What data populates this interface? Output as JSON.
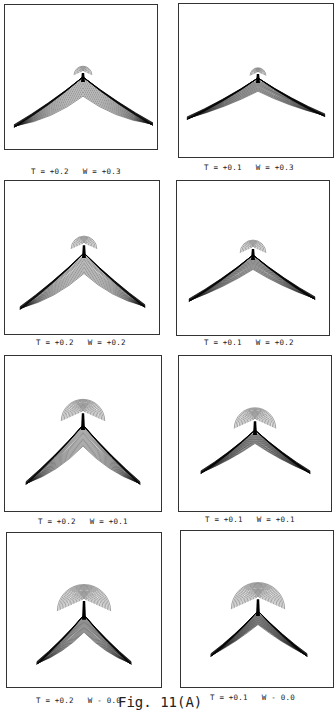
{
  "figure": {
    "caption": "Fig. 11(A)",
    "panels": [
      {
        "id": "r1l",
        "T": "+0.2",
        "W": "+0.3",
        "label": "T = +0.2   W = +0.3",
        "box": [
          4,
          4,
          154,
          146
        ],
        "labelPos": [
          31,
          167
        ],
        "cusp": [
          79,
          75
        ],
        "armL": [
          9,
          124
        ],
        "armR": [
          150,
          122
        ],
        "lobeR": 9,
        "lobeCy": -8,
        "nLines": 14,
        "spread": 0.34
      },
      {
        "id": "r1r",
        "T": "+0.1",
        "W": "+0.3",
        "label": "T = +0.1   W = +0.3",
        "box": [
          178,
          3,
          156,
          155
        ],
        "labelPos": [
          204,
          163
        ],
        "cusp": [
          80,
          77
        ],
        "armL": [
          8,
          117
        ],
        "armR": [
          148,
          114
        ],
        "lobeR": 8,
        "lobeCy": -8,
        "nLines": 14,
        "spread": 0.16
      },
      {
        "id": "r2l",
        "T": "+0.2",
        "W": "+0.2",
        "label": "T = +0.2   W = +0.2",
        "box": [
          4,
          180,
          156,
          155
        ],
        "labelPos": [
          36,
          338
        ],
        "cusp": [
          80,
          75
        ],
        "armL": [
          15,
          130
        ],
        "armR": [
          142,
          128
        ],
        "lobeR": 13,
        "lobeCy": -12,
        "nLines": 15,
        "spread": 0.3
      },
      {
        "id": "r2r",
        "T": "+0.1",
        "W": "+0.2",
        "label": "T = +0.1   W = +0.2",
        "box": [
          176,
          180,
          154,
          156
        ],
        "labelPos": [
          204,
          338
        ],
        "cusp": [
          77,
          77
        ],
        "armL": [
          12,
          122
        ],
        "armR": [
          140,
          120
        ],
        "lobeR": 13,
        "lobeCy": -10,
        "nLines": 15,
        "spread": 0.15
      },
      {
        "id": "r3l",
        "T": "+0.2",
        "W": "+0.1",
        "label": "T = +0.2   W = +0.1",
        "box": [
          4,
          355,
          158,
          157
        ],
        "labelPos": [
          38,
          517
        ],
        "cusp": [
          79,
          72
        ],
        "armL": [
          21,
          130
        ],
        "armR": [
          137,
          130
        ],
        "lobeR": 22,
        "lobeCy": -16,
        "nLines": 17,
        "spread": 0.28
      },
      {
        "id": "r3r",
        "T": "+0.1",
        "W": "+0.1",
        "label": "T = +0.1   W = +0.1",
        "box": [
          178,
          355,
          154,
          157
        ],
        "labelPos": [
          205,
          515
        ],
        "cusp": [
          77,
          77
        ],
        "armL": [
          22,
          119
        ],
        "armR": [
          133,
          119
        ],
        "lobeR": 21,
        "lobeCy": -13,
        "nLines": 17,
        "spread": 0.14
      },
      {
        "id": "r4l",
        "T": "+0.2",
        "W": "0.0",
        "label": "T = +0.2   W - 0.0",
        "box": [
          6,
          532,
          156,
          156
        ],
        "labelPos": [
          36,
          696
        ],
        "cusp": [
          78,
          85
        ],
        "armL": [
          30,
          133
        ],
        "armR": [
          126,
          133
        ],
        "lobeR": 27,
        "lobeCy": -18,
        "nLines": 19,
        "spread": 0.26
      },
      {
        "id": "r4r",
        "T": "+0.1",
        "W": "0.0",
        "label": "T = +0.1   W - 0.0",
        "box": [
          180,
          530,
          154,
          158
        ],
        "labelPos": [
          210,
          693
        ],
        "cusp": [
          78,
          83
        ],
        "armL": [
          30,
          127
        ],
        "armR": [
          128,
          127
        ],
        "lobeR": 27,
        "lobeCy": -16,
        "nLines": 19,
        "spread": 0.12
      }
    ]
  },
  "chart_data": {
    "type": "line",
    "title": "Fig. 11(A)",
    "grid": false,
    "layout": "4 rows x 2 columns",
    "series": [
      {
        "name": "T = +0.2, W = +0.3",
        "T": 0.2,
        "W": 0.3,
        "row": 1,
        "col": 1
      },
      {
        "name": "T = +0.1, W = +0.3",
        "T": 0.1,
        "W": 0.3,
        "row": 1,
        "col": 2
      },
      {
        "name": "T = +0.2, W = +0.2",
        "T": 0.2,
        "W": 0.2,
        "row": 2,
        "col": 1
      },
      {
        "name": "T = +0.1, W = +0.2",
        "T": 0.1,
        "W": 0.2,
        "row": 2,
        "col": 2
      },
      {
        "name": "T = +0.2, W = +0.1",
        "T": 0.2,
        "W": 0.1,
        "row": 3,
        "col": 1
      },
      {
        "name": "T = +0.1, W = +0.1",
        "T": 0.1,
        "W": 0.1,
        "row": 3,
        "col": 2
      },
      {
        "name": "T = +0.2, W = 0.0",
        "T": 0.2,
        "W": 0.0,
        "row": 4,
        "col": 1
      },
      {
        "name": "T = +0.1, W = 0.0",
        "T": 0.1,
        "W": 0.0,
        "row": 4,
        "col": 2
      }
    ],
    "xlabel": "",
    "ylabel": ""
  }
}
